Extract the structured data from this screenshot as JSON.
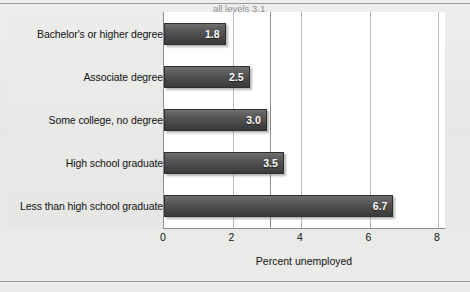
{
  "chart_data": {
    "type": "bar",
    "orientation": "horizontal",
    "title": "",
    "xlabel": "Percent unemployed",
    "ylabel": "",
    "categories": [
      "Bachelor's or higher degree",
      "Associate degree",
      "Some college, no degree",
      "High school graduate",
      "Less than high school graduate"
    ],
    "values": [
      1.8,
      2.5,
      3.0,
      3.5,
      6.7
    ],
    "value_labels": [
      "1.8",
      "2.5",
      "3.0",
      "3.5",
      "6.7"
    ],
    "xlim": [
      0,
      8
    ],
    "xticks": [
      0,
      2,
      4,
      6,
      8
    ],
    "xtick_labels": [
      "0",
      "2",
      "4",
      "6",
      "8"
    ],
    "grid": true,
    "legend": null,
    "annotations": [
      {
        "text": "all levels 3.1",
        "value": 3.1,
        "kind": "reference-line",
        "color": "#8d8d8d"
      }
    ],
    "colors": {
      "bar_top": "#6e6e6e",
      "bar_bottom": "#3a3a3a",
      "bar_border": "#2e2e2e",
      "value_label": "#ffffff",
      "gridline": "#b9b9b9",
      "axis": "#8b8b8b",
      "background": "#e9e9e7",
      "plot_background": "#ffffff",
      "text": "#111111",
      "annotation": "#8d8d8d"
    }
  }
}
